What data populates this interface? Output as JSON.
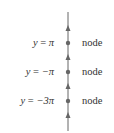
{
  "diagram": {
    "type": "phase-line",
    "equilibria": [
      {
        "label_var": "y",
        "label_eq": " = ",
        "label_val": "π",
        "classification": "node"
      },
      {
        "label_var": "y",
        "label_eq": " = ",
        "label_val": "−π",
        "classification": "node"
      },
      {
        "label_var": "y",
        "label_eq": " = ",
        "label_val": "−3π",
        "classification": "node"
      }
    ],
    "arrow_direction": "up",
    "colors": {
      "line": "#555555",
      "text": "#333333"
    }
  }
}
